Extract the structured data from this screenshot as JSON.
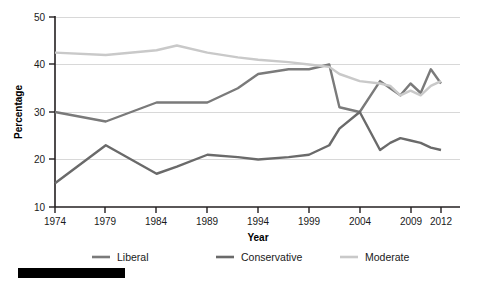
{
  "chart_data": {
    "type": "line",
    "title": "",
    "xlabel": "Year",
    "ylabel": "Percentage",
    "xlim": [
      1974,
      2012
    ],
    "ylim": [
      10,
      50
    ],
    "yticks": [
      10,
      20,
      30,
      40,
      50
    ],
    "xticks": [
      1974,
      1979,
      1984,
      1989,
      1994,
      1999,
      2004,
      2009,
      2012
    ],
    "grid": "horizontal",
    "legend_position": "bottom",
    "x": [
      1974,
      1979,
      1984,
      1986,
      1989,
      1992,
      1994,
      1997,
      1999,
      2001,
      2002,
      2004,
      2006,
      2007,
      2008,
      2009,
      2010,
      2011,
      2012
    ],
    "series": [
      {
        "name": "Liberal",
        "color": "#7a7a7a",
        "values": [
          30,
          28,
          32,
          32,
          32,
          35,
          38,
          39,
          39,
          40,
          31,
          30,
          36.5,
          35,
          33.5,
          36,
          34,
          39,
          36
        ]
      },
      {
        "name": "Conservative",
        "color": "#6a6a6a",
        "values": [
          15,
          23,
          17,
          18.5,
          21,
          20.5,
          20,
          20.5,
          21,
          23,
          26.5,
          30,
          22,
          23.5,
          24.5,
          24,
          23.5,
          22.5,
          22
        ]
      },
      {
        "name": "Moderate",
        "color": "#c9c9c9",
        "values": [
          42.5,
          42,
          43,
          44,
          42.5,
          41.5,
          41,
          40.5,
          40,
          39.5,
          38,
          36.5,
          36,
          35.5,
          33.5,
          34.5,
          33.5,
          35.5,
          36.5
        ]
      }
    ]
  },
  "axes": {
    "y_title": "Percentage",
    "x_title": "Year",
    "y_tick_labels": [
      "50",
      "40",
      "30",
      "20",
      "10"
    ],
    "x_tick_labels": [
      "1974",
      "1979",
      "1984",
      "1989",
      "1994",
      "1999",
      "2004",
      "2009",
      "2012"
    ]
  },
  "legend": {
    "items": [
      {
        "label": "Liberal",
        "color": "#7a7a7a"
      },
      {
        "label": "Conservative",
        "color": "#6a6a6a"
      },
      {
        "label": "Moderate",
        "color": "#c9c9c9"
      }
    ]
  },
  "colors": {
    "background": "#ffffff",
    "axis": "#231f20",
    "grid": "#d8d8d8",
    "footer_bar": "#000000"
  }
}
